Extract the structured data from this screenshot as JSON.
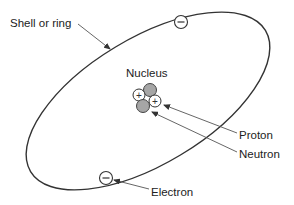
{
  "diagram": {
    "labels": {
      "shell": "Shell or ring",
      "nucleus": "Nucleus",
      "proton": "Proton",
      "neutron": "Neutron",
      "electron": "Electron"
    },
    "symbols": {
      "proton_charge": "+",
      "electron_charge": "−"
    },
    "colors": {
      "line": "#333333",
      "neutron_fill": "#a6a6a6",
      "proton_fill": "#ffffff",
      "arrow": "#555555"
    }
  }
}
